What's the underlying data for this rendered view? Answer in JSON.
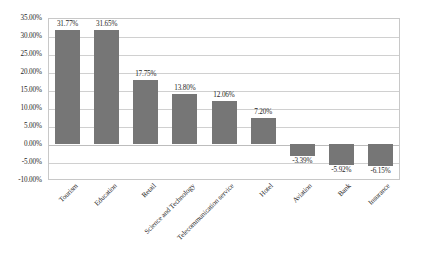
{
  "chart_data": {
    "type": "bar",
    "title": "",
    "subtitle": "",
    "xlabel": "",
    "ylabel": "",
    "categories": [
      "Tourism",
      "Education",
      "Retail",
      "Science and Technology",
      "Telecommunication service",
      "Hotel",
      "Aviation",
      "Bank",
      "Insurance"
    ],
    "values": [
      31.77,
      31.65,
      17.75,
      13.8,
      12.06,
      7.2,
      -3.39,
      -5.92,
      -6.15
    ],
    "value_labels": [
      "31.77%",
      "31.65%",
      "17.75%",
      "13.80%",
      "12.06%",
      "7.20%",
      "-3.39%",
      "-5.92%",
      "-6.15%"
    ],
    "ylim": [
      -10,
      35
    ],
    "ytick_values": [
      35,
      30,
      25,
      20,
      15,
      10,
      5,
      0,
      -5,
      -10
    ],
    "ytick_labels": [
      "35.00%",
      "30.00%",
      "25.00%",
      "20.00%",
      "15.00%",
      "10.00%",
      "5.00%",
      "0.00%",
      "-5.00%",
      "-10.00%"
    ],
    "grid": true,
    "legend": false,
    "legend_position": "none",
    "bar_color": "#767676",
    "gridline_color": "#d0d0d0",
    "plot_border_color": "#c8c8c8",
    "background_color": "#ffffff",
    "xlabel_rotation": -45
  }
}
